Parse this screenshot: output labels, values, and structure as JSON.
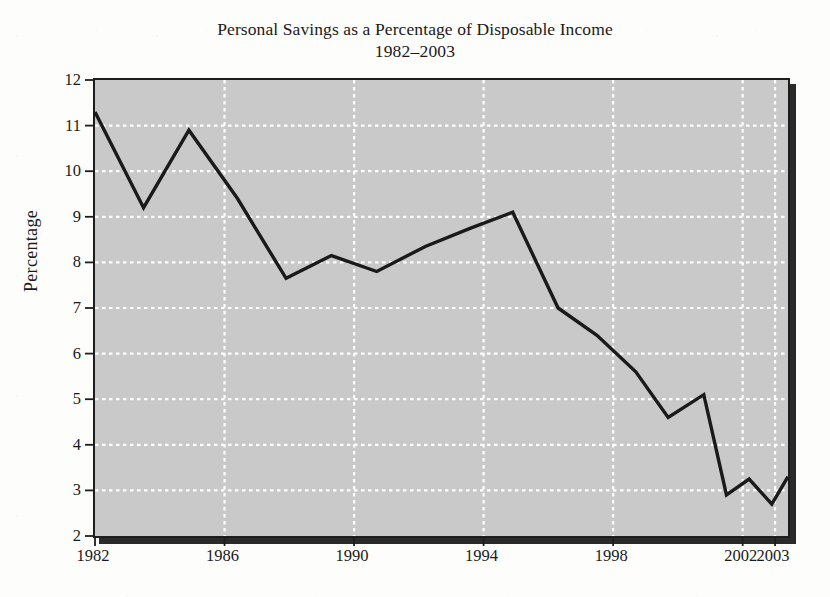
{
  "title": "Personal Savings as a Percentage of Disposable Income",
  "subtitle": "1982–2003",
  "axis": {
    "ylabel": "Percentage",
    "xlabel": ""
  },
  "colors": {
    "plot_background": "#c9c9c9",
    "grid": "#ffffff",
    "line": "#1a1a1a",
    "frame": "#1d1d1d",
    "page_background": "#fdfdfc",
    "text": "#1a1a1a"
  },
  "chart_data": {
    "type": "line",
    "title": "Personal Savings as a Percentage of Disposable Income",
    "subtitle": "1982–2003",
    "xlabel": "",
    "ylabel": "Percentage",
    "xlim": [
      1982,
      2003.4
    ],
    "ylim": [
      2,
      12
    ],
    "ytick_values": [
      2,
      3,
      4,
      5,
      6,
      7,
      8,
      9,
      10,
      11,
      12
    ],
    "ytick_labels": [
      "2",
      "3",
      "4",
      "5",
      "6",
      "7",
      "8",
      "9",
      "10",
      "11",
      "12"
    ],
    "xtick_values": [
      1982,
      1986,
      1990,
      1994,
      1998,
      2002,
      2003
    ],
    "xtick_labels": [
      "1982",
      "1986",
      "1990",
      "1994",
      "1998",
      "2002",
      "2003"
    ],
    "grid": true,
    "grid_style": "dotted-white",
    "legend": false,
    "series": [
      {
        "name": "Personal savings rate",
        "x": [
          1982.0,
          1983.5,
          1984.9,
          1986.4,
          1987.9,
          1989.3,
          1990.7,
          1992.2,
          1993.6,
          1994.9,
          1996.3,
          1997.5,
          1998.7,
          1999.7,
          2000.8,
          2001.5,
          2002.2,
          2002.9
        ],
        "values": [
          11.3,
          9.2,
          10.9,
          9.4,
          7.65,
          8.15,
          7.8,
          8.35,
          8.75,
          9.1,
          7.0,
          6.4,
          5.6,
          4.6,
          5.1,
          2.9,
          3.25,
          2.7
        ],
        "final_point": {
          "x": 2003.4,
          "value": 3.3
        }
      }
    ]
  }
}
